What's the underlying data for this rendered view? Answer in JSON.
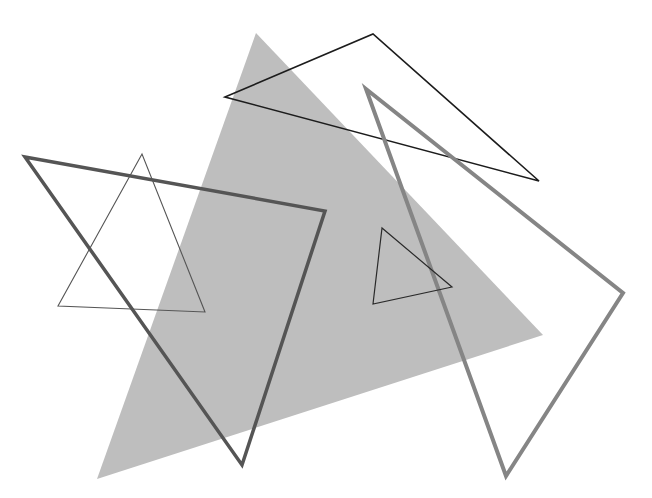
{
  "canvas": {
    "width": 652,
    "height": 498,
    "background": "#ffffff"
  },
  "shapes": [
    {
      "id": "large-gray-filled-triangle",
      "type": "triangle",
      "points": [
        [
          256,
          33
        ],
        [
          543,
          335
        ],
        [
          97,
          479
        ]
      ],
      "fill": "#bebebe",
      "stroke": "none",
      "stroke_width": 0
    },
    {
      "id": "black-thin-triangle-top",
      "type": "triangle",
      "points": [
        [
          225,
          97
        ],
        [
          373,
          34
        ],
        [
          539,
          181
        ]
      ],
      "fill": "none",
      "stroke": "#1c1c1c",
      "stroke_width": 1.6
    },
    {
      "id": "gray-thick-triangle-right",
      "type": "triangle",
      "points": [
        [
          366,
          89
        ],
        [
          623,
          293
        ],
        [
          506,
          476
        ]
      ],
      "fill": "none",
      "stroke": "#858585",
      "stroke_width": 4
    },
    {
      "id": "dark-thick-triangle-left",
      "type": "triangle",
      "points": [
        [
          25,
          157
        ],
        [
          325,
          211
        ],
        [
          242,
          465
        ]
      ],
      "fill": "none",
      "stroke": "#555555",
      "stroke_width": 3.5
    },
    {
      "id": "thin-triangle-left",
      "type": "triangle",
      "points": [
        [
          142,
          154
        ],
        [
          58,
          306
        ],
        [
          205,
          312
        ]
      ],
      "fill": "none",
      "stroke": "#555555",
      "stroke_width": 1.1
    },
    {
      "id": "small-black-triangle",
      "type": "triangle",
      "points": [
        [
          382,
          228
        ],
        [
          373,
          304
        ],
        [
          452,
          287
        ]
      ],
      "fill": "none",
      "stroke": "#2a2a2a",
      "stroke_width": 1.2
    }
  ]
}
